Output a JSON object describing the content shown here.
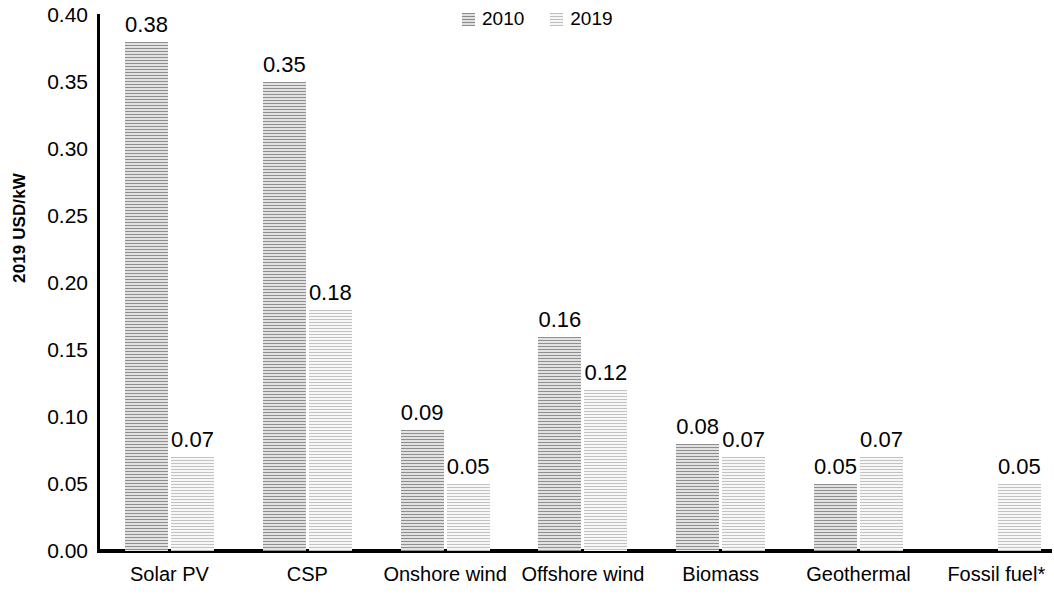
{
  "chart_data": {
    "type": "bar",
    "title": "",
    "subtitle": "",
    "xlabel": "",
    "ylabel": "2019 USD/kW",
    "ylim": [
      0.0,
      0.4
    ],
    "ytick_step": 0.05,
    "ytick_labels": [
      "0.40",
      "0.35",
      "0.30",
      "0.25",
      "0.20",
      "0.15",
      "0.10",
      "0.05",
      "0.00"
    ],
    "ytick_values": [
      0.4,
      0.35,
      0.3,
      0.25,
      0.2,
      0.15,
      0.1,
      0.05,
      0.0
    ],
    "grid": false,
    "legend_position": "top-center",
    "categories": [
      "Solar PV",
      "CSP",
      "Onshore wind",
      "Offshore wind",
      "Biomass",
      "Geothermal",
      "Fossil fuel*"
    ],
    "series": [
      {
        "name": "2010",
        "values": [
          0.38,
          0.35,
          0.09,
          0.16,
          0.08,
          0.05,
          null
        ],
        "labels": [
          "0.38",
          "0.35",
          "0.09",
          "0.16",
          "0.08",
          "0.05",
          ""
        ],
        "color": "#8f8f8f"
      },
      {
        "name": "2019",
        "values": [
          0.07,
          0.18,
          0.05,
          0.12,
          0.07,
          0.07,
          0.05
        ],
        "labels": [
          "0.07",
          "0.18",
          "0.05",
          "0.12",
          "0.07",
          "0.07",
          "0.05"
        ],
        "color": "#c2c2c2"
      }
    ],
    "footnote": ""
  },
  "legend": {
    "items": [
      {
        "label": "2010",
        "series_key": "s2010"
      },
      {
        "label": "2019",
        "series_key": "s2019"
      }
    ]
  }
}
